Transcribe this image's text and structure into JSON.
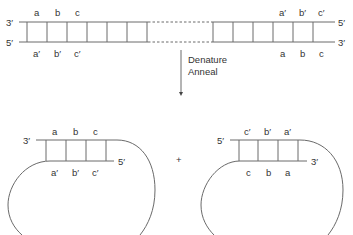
{
  "top_duplex": {
    "left_end": {
      "top": "3′",
      "bottom": "5′"
    },
    "right_end": {
      "top": "5′",
      "bottom": "3′"
    },
    "left_top_labels": [
      "a",
      "b",
      "c"
    ],
    "left_bottom_labels": [
      "a′",
      "b′",
      "c′"
    ],
    "right_top_labels": [
      "a′",
      "b′",
      "c′"
    ],
    "right_bottom_labels": [
      "a",
      "b",
      "c"
    ]
  },
  "arrow": {
    "line1": "Denature",
    "line2": "Anneal"
  },
  "left_hairpin": {
    "end_top": "3′",
    "end_bottom": "5′",
    "top_labels": [
      "a",
      "b",
      "c"
    ],
    "bottom_labels": [
      "a′",
      "b′",
      "c′"
    ]
  },
  "plus": "+",
  "right_hairpin": {
    "end_top": "5′",
    "end_bottom": "3′",
    "top_labels": [
      "c′",
      "b′",
      "a′"
    ],
    "bottom_labels": [
      "c",
      "b",
      "a"
    ]
  },
  "colors": {
    "line": "#6a6a6a",
    "text": "#333333"
  }
}
